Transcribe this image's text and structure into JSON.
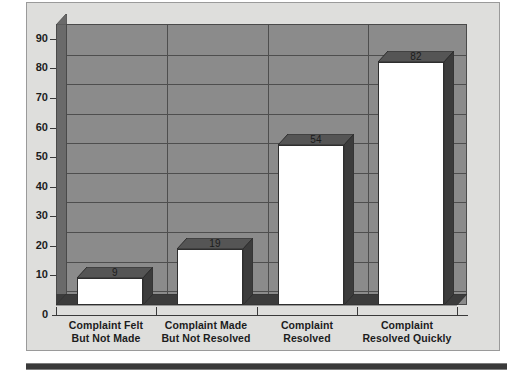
{
  "chart_data": {
    "type": "bar",
    "title": "",
    "subtitle": "",
    "xlabel": "",
    "ylabel": "",
    "categories": [
      "Complaint Felt\nBut Not Made",
      "Complaint Made\nBut Not Resolved",
      "Complaint\nResolved",
      "Complaint\nResolved Quickly"
    ],
    "category_lines": [
      [
        "Complaint Felt",
        "But Not Made"
      ],
      [
        "Complaint Made",
        "But Not Resolved"
      ],
      [
        "Complaint",
        "Resolved"
      ],
      [
        "Complaint",
        "Resolved Quickly"
      ]
    ],
    "values": [
      9,
      19,
      54,
      82
    ],
    "value_labels": [
      "9",
      "19",
      "54",
      "82"
    ],
    "ylim": [
      0,
      95
    ],
    "yticks": [
      0,
      10,
      20,
      30,
      40,
      50,
      60,
      70,
      80,
      90
    ],
    "ytick_labels": [
      "0",
      "10",
      "20",
      "30",
      "40",
      "50",
      "60",
      "70",
      "80",
      "90"
    ],
    "gridlines": [
      5,
      15,
      25,
      35,
      45,
      55,
      65,
      75,
      85
    ],
    "grid": true,
    "legend": null,
    "legend_position": "none",
    "style": "3d-column",
    "colors": {
      "page_background": "#ffffff",
      "panel_background": "#dededc",
      "panel_border": "#9a9a9a",
      "plot_background": "#8b8b8b",
      "gridline": "#4e4e4e",
      "bar_front": "#ffffff",
      "bar_top": "#555555",
      "bar_side": "#3c3c3c",
      "bar_outline": "#2e2e2e",
      "wall": "#6a6a6a",
      "floor": "#3c3c3c",
      "axis": "#3a3a3a",
      "text": "#1c1c1c",
      "rule": "#3a3a3a"
    }
  }
}
